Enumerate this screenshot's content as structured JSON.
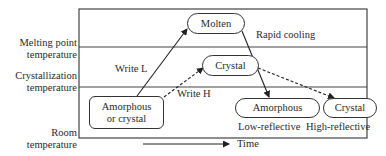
{
  "diagram": {
    "y_axis_labels": [
      {
        "id": "melting",
        "line1": "Melting point",
        "line2": "temperature"
      },
      {
        "id": "crystallization",
        "line1": "Crystallization",
        "line2": "temperature"
      },
      {
        "id": "room",
        "line1": "Room",
        "line2": "temperature"
      }
    ],
    "nodes": {
      "molten": "Molten",
      "crystal_mid": "Crystal",
      "start_line1": "Amorphous",
      "start_line2": "or crystal",
      "amorphous_final": "Amorphous",
      "crystal_final": "Crystal"
    },
    "edge_labels": {
      "write_l": "Write L",
      "write_h": "Write H",
      "rapid_cooling": "Rapid cooling"
    },
    "state_labels": {
      "low": "Low-reflective",
      "high": "High-reflective"
    },
    "x_axis": {
      "label": "Time"
    }
  }
}
